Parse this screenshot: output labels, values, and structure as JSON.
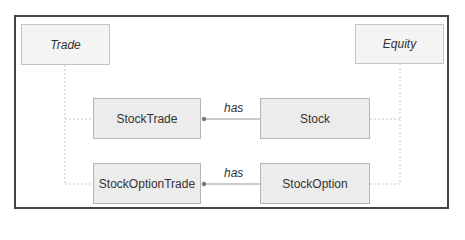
{
  "diagram": {
    "type": "class-diagram",
    "nodes": {
      "trade": {
        "label": "Trade",
        "abstract": true
      },
      "equity": {
        "label": "Equity",
        "abstract": true
      },
      "stock_trade": {
        "label": "StockTrade"
      },
      "stock": {
        "label": "Stock"
      },
      "stock_option_trade": {
        "label": "StockOptionTrade"
      },
      "stock_option": {
        "label": "StockOption"
      }
    },
    "edges": [
      {
        "from": "stock_trade",
        "to": "trade",
        "kind": "inheritance"
      },
      {
        "from": "stock_option_trade",
        "to": "trade",
        "kind": "inheritance"
      },
      {
        "from": "stock",
        "to": "equity",
        "kind": "inheritance"
      },
      {
        "from": "stock_option",
        "to": "equity",
        "kind": "inheritance"
      },
      {
        "from": "stock_trade",
        "to": "stock",
        "kind": "aggregation",
        "label": "has"
      },
      {
        "from": "stock_option_trade",
        "to": "stock_option",
        "kind": "aggregation",
        "label": "has"
      }
    ],
    "labels": {
      "has_top": "has",
      "has_bottom": "has"
    },
    "colors": {
      "box_fill": "#ececec",
      "box_border": "#b5b5b5",
      "frame": "#444444",
      "connector": "#999999"
    }
  }
}
